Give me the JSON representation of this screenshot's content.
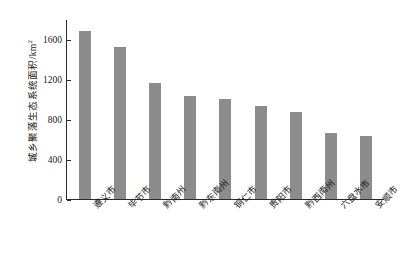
{
  "chart_data": {
    "type": "bar",
    "title": "",
    "xlabel": "",
    "ylabel": "城乡聚落生态系统面积/km",
    "ylabel_sup": "2",
    "categories": [
      "遵义市",
      "毕节市",
      "黔南州",
      "黔东南州",
      "铜仁市",
      "贵阳市",
      "黔西南州",
      "六盘水市",
      "安顺市"
    ],
    "values": [
      1680,
      1520,
      1160,
      1030,
      1000,
      930,
      870,
      665,
      630
    ],
    "ylim": [
      0,
      1800
    ],
    "yticks": [
      0,
      400,
      800,
      1200,
      1600
    ],
    "ytick_labels": [
      "0",
      "400",
      "800",
      "1200",
      "1600"
    ],
    "grid": false,
    "legend": false,
    "bar_color": "#8c8c8c",
    "axis_color": "#2b2b2b"
  }
}
